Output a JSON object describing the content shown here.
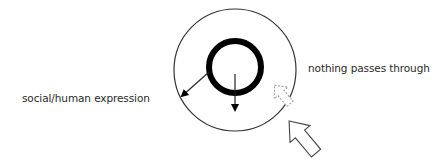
{
  "diagram": {
    "labels": {
      "left": "social/human expression",
      "right": "nothing passes through"
    },
    "elements": {
      "outer_circle": {
        "cx": 235,
        "cy": 70,
        "r": 61,
        "stroke": "#333333"
      },
      "inner_circle": {
        "cx": 235,
        "cy": 67,
        "r": 26,
        "stroke": "#000000",
        "stroke_width": 6
      },
      "arrows": [
        {
          "name": "inner-to-outer-arrow",
          "style": "solid-line",
          "direction": "down-left"
        },
        {
          "name": "downward-arrow",
          "style": "solid-line",
          "direction": "down"
        },
        {
          "name": "small-block-arrow",
          "style": "hollow-dashed",
          "direction": "up-left"
        },
        {
          "name": "large-block-arrow",
          "style": "hollow",
          "direction": "up-left"
        }
      ]
    }
  }
}
